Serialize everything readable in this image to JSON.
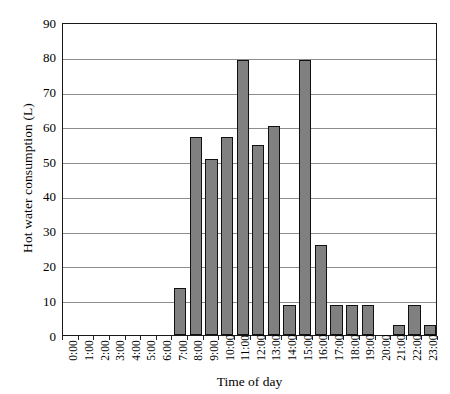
{
  "chart_data": {
    "type": "bar",
    "title": "",
    "xlabel": "Time of day",
    "ylabel": "Hot water consumption (L)",
    "categories": [
      "0:00",
      "1:00",
      "2:00",
      "3:00",
      "4:00",
      "5:00",
      "6:00",
      "7:00",
      "8:00",
      "9:00",
      "10:00",
      "11:00",
      "12:00",
      "13:00",
      "14:00",
      "15:00",
      "16:00",
      "17:00",
      "18:00",
      "19:00",
      "20:00",
      "21:00",
      "22:00",
      "23:00"
    ],
    "values": [
      0,
      0,
      0,
      0,
      0,
      0,
      0,
      13.5,
      57,
      50.5,
      57,
      79,
      54.5,
      60,
      8.5,
      79,
      26,
      8.5,
      8.5,
      8.5,
      0,
      3,
      8.5,
      3
    ],
    "ylim": [
      0,
      90
    ],
    "yticks": [
      0,
      10,
      20,
      30,
      40,
      50,
      60,
      70,
      80,
      90
    ],
    "ytick_labels": [
      "0",
      "10",
      "20",
      "30",
      "40",
      "50",
      "60",
      "70",
      "80",
      "90"
    ],
    "grid": "horizontal",
    "legend": "none",
    "bar_color": "#808080",
    "bar_edge_color": "#111111",
    "grid_color": "#8c8c8c",
    "axis_color": "#1a1a1a",
    "background": "#ffffff"
  }
}
